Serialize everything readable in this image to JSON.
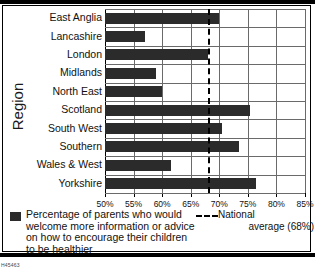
{
  "chart_data": {
    "type": "bar",
    "orientation": "horizontal",
    "title": "",
    "xlabel": "",
    "ylabel": "Region",
    "categories": [
      "East Anglia",
      "Lancashire",
      "London",
      "Midlands",
      "North East",
      "Scotland",
      "South West",
      "Southern",
      "Wales & West",
      "Yorkshire"
    ],
    "values": [
      70.0,
      57.0,
      68.0,
      59.0,
      60.0,
      75.3,
      70.5,
      73.5,
      61.5,
      76.5
    ],
    "series": [
      {
        "name": "Percentage of parents who would welcome more information or advice on how to encourage their children to be healthier",
        "values": [
          70.0,
          57.0,
          68.0,
          59.0,
          60.0,
          75.3,
          70.5,
          73.5,
          61.5,
          76.5
        ]
      }
    ],
    "xlim": [
      50,
      85
    ],
    "xticks": [
      50,
      55,
      60,
      65,
      70,
      75,
      80,
      85
    ],
    "xticklabels": [
      "50%",
      "55%",
      "60%",
      "65%",
      "70%",
      "75%",
      "80%",
      "85%"
    ],
    "grid": "vertical",
    "reference_line": {
      "value": 68,
      "style": "dashed",
      "label_line1": "National",
      "label_line2": "average (68%)"
    },
    "legend": {
      "position": "below",
      "series_label": "Percentage of parents who would welcome more information or advice on how to encourage their children to be healthier",
      "series_label_lines": [
        "Percentage of parents who would",
        "welcome more information or advice",
        "on how to encourage their children",
        "to be healthier"
      ]
    },
    "colors": {
      "bar": "#2b2b2b",
      "grid": "#6a6a6a",
      "axis": "#000000",
      "background": "#ffffff"
    }
  },
  "footer": {
    "code": "H45463"
  }
}
